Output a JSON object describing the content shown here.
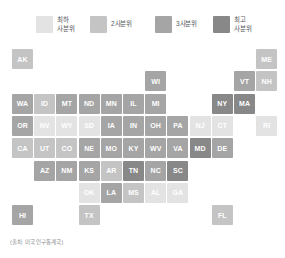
{
  "legend": {
    "title": "",
    "items": [
      {
        "label": "최하\n사분위",
        "color": "#e3e3e3",
        "quartile": 1
      },
      {
        "label": "2사분위",
        "color": "#c4c4c4",
        "quartile": 2
      },
      {
        "label": "3사분위",
        "color": "#a5a5a5",
        "quartile": 3
      },
      {
        "label": "최고\n사분위",
        "color": "#888888",
        "quartile": 4
      }
    ]
  },
  "source_note": "(출처: 미국 인구통계국)",
  "palette": {
    "q1": "#e3e3e3",
    "q2": "#c4c4c4",
    "q3": "#a5a5a5",
    "q4": "#888888",
    "label_light": "#ffffff",
    "background": "#ffffff"
  },
  "chart_data": {
    "type": "heatmap",
    "title": "",
    "xlabel": "",
    "ylabel": "",
    "grid": false,
    "legend_position": "top",
    "categories": [
      "최하 사분위",
      "2사분위",
      "3사분위",
      "최고 사분위"
    ],
    "values_legend": [
      1,
      2,
      3,
      4
    ],
    "cell_size_px": 21,
    "grid_cols": 12,
    "grid_rows": 8,
    "cells": [
      {
        "code": "AK",
        "col": 0,
        "row": 0,
        "quartile": 2
      },
      {
        "code": "ME",
        "col": 11,
        "row": 0,
        "quartile": 2
      },
      {
        "code": "WI",
        "col": 6,
        "row": 1,
        "quartile": 3
      },
      {
        "code": "VT",
        "col": 10,
        "row": 1,
        "quartile": 3
      },
      {
        "code": "NH",
        "col": 11,
        "row": 1,
        "quartile": 2
      },
      {
        "code": "WA",
        "col": 0,
        "row": 2,
        "quartile": 3
      },
      {
        "code": "ID",
        "col": 1,
        "row": 2,
        "quartile": 2
      },
      {
        "code": "MT",
        "col": 2,
        "row": 2,
        "quartile": 3
      },
      {
        "code": "ND",
        "col": 3,
        "row": 2,
        "quartile": 3
      },
      {
        "code": "MN",
        "col": 4,
        "row": 2,
        "quartile": 3
      },
      {
        "code": "IL",
        "col": 5,
        "row": 2,
        "quartile": 3
      },
      {
        "code": "MI",
        "col": 6,
        "row": 2,
        "quartile": 3
      },
      {
        "code": "NY",
        "col": 9,
        "row": 2,
        "quartile": 4
      },
      {
        "code": "MA",
        "col": 10,
        "row": 2,
        "quartile": 4
      },
      {
        "code": "OR",
        "col": 0,
        "row": 3,
        "quartile": 3
      },
      {
        "code": "NV",
        "col": 1,
        "row": 3,
        "quartile": 1
      },
      {
        "code": "WY",
        "col": 2,
        "row": 3,
        "quartile": 1
      },
      {
        "code": "SD",
        "col": 3,
        "row": 3,
        "quartile": 1
      },
      {
        "code": "IA",
        "col": 4,
        "row": 3,
        "quartile": 3
      },
      {
        "code": "IN",
        "col": 5,
        "row": 3,
        "quartile": 3
      },
      {
        "code": "OH",
        "col": 6,
        "row": 3,
        "quartile": 3
      },
      {
        "code": "PA",
        "col": 7,
        "row": 3,
        "quartile": 3
      },
      {
        "code": "NJ",
        "col": 8,
        "row": 3,
        "quartile": 1
      },
      {
        "code": "CT",
        "col": 9,
        "row": 3,
        "quartile": 1
      },
      {
        "code": "RI",
        "col": 11,
        "row": 3,
        "quartile": 1
      },
      {
        "code": "CA",
        "col": 0,
        "row": 4,
        "quartile": 2
      },
      {
        "code": "UT",
        "col": 1,
        "row": 4,
        "quartile": 2
      },
      {
        "code": "CO",
        "col": 2,
        "row": 4,
        "quartile": 2
      },
      {
        "code": "NE",
        "col": 3,
        "row": 4,
        "quartile": 3
      },
      {
        "code": "MO",
        "col": 4,
        "row": 4,
        "quartile": 3
      },
      {
        "code": "KY",
        "col": 5,
        "row": 4,
        "quartile": 3
      },
      {
        "code": "WV",
        "col": 6,
        "row": 4,
        "quartile": 3
      },
      {
        "code": "VA",
        "col": 7,
        "row": 4,
        "quartile": 3
      },
      {
        "code": "MD",
        "col": 8,
        "row": 4,
        "quartile": 4
      },
      {
        "code": "DE",
        "col": 9,
        "row": 4,
        "quartile": 3
      },
      {
        "code": "AZ",
        "col": 1,
        "row": 5,
        "quartile": 3
      },
      {
        "code": "NM",
        "col": 2,
        "row": 5,
        "quartile": 3
      },
      {
        "code": "KS",
        "col": 3,
        "row": 5,
        "quartile": 3
      },
      {
        "code": "AR",
        "col": 4,
        "row": 5,
        "quartile": 2
      },
      {
        "code": "TN",
        "col": 5,
        "row": 5,
        "quartile": 4
      },
      {
        "code": "NC",
        "col": 6,
        "row": 5,
        "quartile": 3
      },
      {
        "code": "SC",
        "col": 7,
        "row": 5,
        "quartile": 4
      },
      {
        "code": "OK",
        "col": 3,
        "row": 6,
        "quartile": 1
      },
      {
        "code": "LA",
        "col": 4,
        "row": 6,
        "quartile": 3
      },
      {
        "code": "MS",
        "col": 5,
        "row": 6,
        "quartile": 2
      },
      {
        "code": "AL",
        "col": 6,
        "row": 6,
        "quartile": 1
      },
      {
        "code": "GA",
        "col": 7,
        "row": 6,
        "quartile": 1
      },
      {
        "code": "HI",
        "col": 0,
        "row": 7,
        "quartile": 3
      },
      {
        "code": "TX",
        "col": 3,
        "row": 7,
        "quartile": 2
      },
      {
        "code": "FL",
        "col": 9,
        "row": 7,
        "quartile": 2
      }
    ]
  }
}
